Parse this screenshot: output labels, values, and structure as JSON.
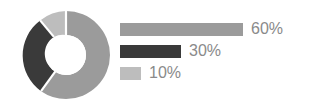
{
  "chart_data": {
    "type": "pie",
    "title": "",
    "subtitle": "",
    "xlabel": "",
    "ylabel": "",
    "grid": false,
    "legend_position": "right",
    "donut": true,
    "inner_radius_ratio": 0.455,
    "start_angle_deg": 0,
    "direction": "clockwise",
    "categories": [
      "60%",
      "30%",
      "10%"
    ],
    "values": [
      60,
      30,
      10
    ],
    "labels": [
      "60%",
      "30%",
      "10%"
    ],
    "colors": [
      "#9b9b9b",
      "#3a3a3a",
      "#bdbdbd"
    ],
    "legend_entries": [
      {
        "label": "60%",
        "value": 60,
        "color": "#9b9b9b",
        "bar_width_px": 123
      },
      {
        "label": "30%",
        "value": 30,
        "color": "#3a3a3a",
        "bar_width_px": 61
      },
      {
        "label": "10%",
        "value": 10,
        "color": "#bdbdbd",
        "bar_width_px": 21
      }
    ]
  },
  "figure": {
    "background_color": "#ffffff",
    "label_color": "#8a8a8a",
    "segment_gap_color": "#ffffff",
    "donut_center_color": "#ffffff"
  },
  "donut": {
    "segments": [
      {
        "name": "segment-60",
        "label": "60%",
        "value": 60,
        "color": "#9b9b9b"
      },
      {
        "name": "segment-30",
        "label": "30%",
        "value": 30,
        "color": "#3a3a3a"
      },
      {
        "name": "segment-10",
        "label": "10%",
        "value": 10,
        "color": "#bdbdbd"
      }
    ]
  }
}
